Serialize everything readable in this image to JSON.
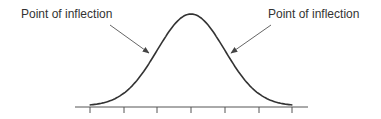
{
  "chart_data": {
    "type": "line",
    "title": "",
    "xlabel": "",
    "ylabel": "",
    "x_ticks": [
      -3,
      -2,
      -1,
      0,
      1,
      2,
      3
    ],
    "x_tick_labels": [],
    "series": [
      {
        "name": "normal curve",
        "x": [
          -3,
          -2,
          -1,
          0,
          1,
          2,
          3
        ],
        "y": [
          0.004,
          0.054,
          0.242,
          0.399,
          0.242,
          0.054,
          0.004
        ]
      }
    ],
    "annotations": [
      {
        "text": "Point of inflection",
        "x": -1,
        "arrow": true
      },
      {
        "text": "Point of inflection",
        "x": 1,
        "arrow": true
      }
    ],
    "grid": false,
    "legend": "none"
  },
  "annotations": {
    "left_label": "Point of inflection",
    "right_label": "Point of inflection"
  },
  "colors": {
    "curve": "#333333",
    "axis": "#555555",
    "arrow": "#666666"
  }
}
